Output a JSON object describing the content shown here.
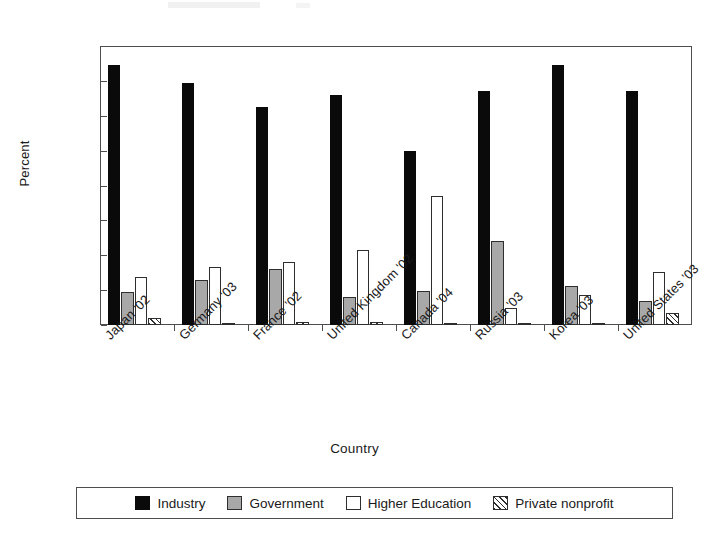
{
  "chart_data": {
    "type": "bar",
    "title": "",
    "xlabel": "Country",
    "ylabel": "Percent",
    "ylim": [
      0.0,
      80.0
    ],
    "ytick_step": 10.0,
    "ytick_labels": [
      "80.0",
      "70.0",
      "60.0",
      "50.0",
      "40.0",
      "30.0",
      "20.0",
      "10.0",
      "0.0"
    ],
    "ytick_values": [
      80.0,
      70.0,
      60.0,
      50.0,
      40.0,
      30.0,
      20.0,
      10.0,
      0.0
    ],
    "grid": false,
    "legend_position": "bottom",
    "categories": [
      "Japan '02",
      "Germany '03",
      "France '02",
      "United Kingdom '02",
      "Canada '04",
      "Russia '03",
      "Korea '03",
      "United States '03"
    ],
    "series": [
      {
        "name": "Industry",
        "style": "solid-black",
        "color": "#0a0a0a",
        "values": [
          74.5,
          69.5,
          62.5,
          66.0,
          50.0,
          67.0,
          74.5,
          67.0
        ]
      },
      {
        "name": "Government",
        "style": "gray-fill",
        "color": "#a8a8a8",
        "values": [
          9.5,
          13.0,
          16.0,
          8.0,
          9.8,
          24.0,
          11.3,
          7.0
        ]
      },
      {
        "name": "Higher Education",
        "style": "white-fill",
        "color": "#ffffff",
        "values": [
          13.8,
          16.5,
          18.2,
          21.5,
          37.0,
          4.8,
          8.6,
          15.2
        ]
      },
      {
        "name": "Private nonprofit",
        "style": "diagonal-hatch",
        "color": "#ffffff",
        "values": [
          2.0,
          0.2,
          0.8,
          1.0,
          0.3,
          0.2,
          0.6,
          3.5
        ]
      }
    ]
  },
  "legend": {
    "items": [
      {
        "label": "Industry",
        "swatch": "solid-black-swatch-icon"
      },
      {
        "label": "Government",
        "swatch": "gray-swatch-icon"
      },
      {
        "label": "Higher Education",
        "swatch": "white-swatch-icon"
      },
      {
        "label": "Private nonprofit",
        "swatch": "hatched-swatch-icon"
      }
    ]
  }
}
